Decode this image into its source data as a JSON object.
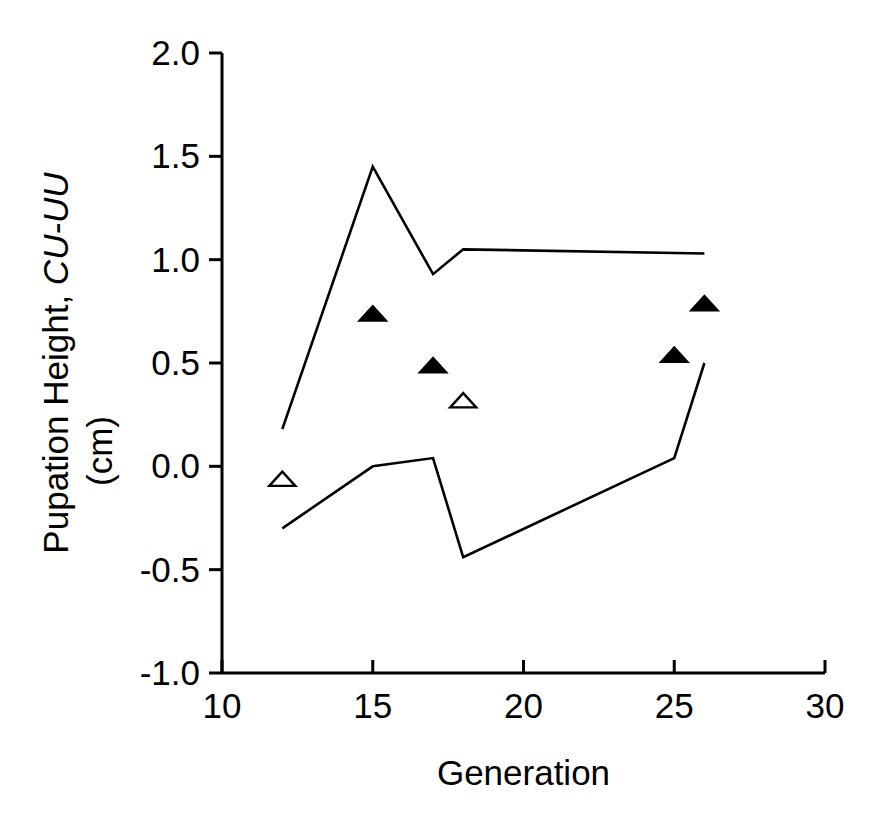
{
  "chart_data": {
    "type": "line",
    "title": "",
    "xlabel": "Generation",
    "ylabel_line1": "Pupation Height, ",
    "ylabel_line1_italic": "CU-UU",
    "ylabel_line2": "(cm)",
    "xlim": [
      10,
      30
    ],
    "ylim": [
      -1.0,
      2.0
    ],
    "xticks": [
      10,
      15,
      20,
      25,
      30
    ],
    "xtick_labels": [
      "10",
      "15",
      "20",
      "25",
      "30"
    ],
    "yticks": [
      -1.0,
      -0.5,
      0.0,
      0.5,
      1.0,
      1.5,
      2.0
    ],
    "ytick_labels": [
      "-1.0",
      "-0.5",
      "0.0",
      "0.5",
      "1.0",
      "1.5",
      "2.0"
    ],
    "grid": false,
    "legend": "none",
    "axis_color": "#000000",
    "series": [
      {
        "name": "upper-confidence-line",
        "type": "line",
        "marker": "none",
        "color": "#000000",
        "x": [
          12,
          15,
          17,
          18,
          26
        ],
        "y": [
          0.18,
          1.45,
          0.93,
          1.05,
          1.03
        ]
      },
      {
        "name": "lower-confidence-line",
        "type": "line",
        "marker": "none",
        "color": "#000000",
        "x": [
          12,
          15,
          17,
          18,
          25,
          26
        ],
        "y": [
          -0.3,
          0.0,
          0.04,
          -0.44,
          0.04,
          0.5
        ]
      },
      {
        "name": "filled-triangle-points",
        "type": "scatter",
        "marker": "filled-triangle",
        "color": "#000000",
        "x": [
          15,
          17,
          25,
          26
        ],
        "y": [
          0.74,
          0.49,
          0.54,
          0.79
        ]
      },
      {
        "name": "open-triangle-points",
        "type": "scatter",
        "marker": "open-triangle",
        "color": "#000000",
        "x": [
          12,
          18
        ],
        "y": [
          -0.06,
          0.32
        ]
      }
    ]
  }
}
